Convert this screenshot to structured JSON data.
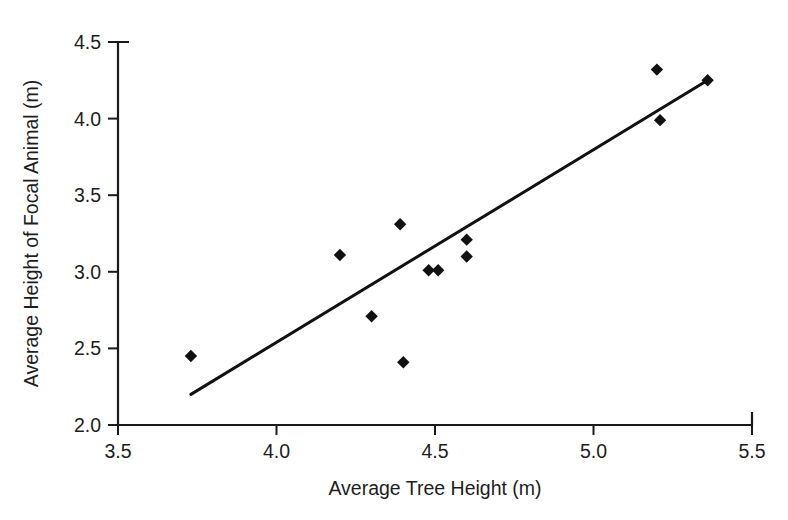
{
  "chart_data": {
    "type": "scatter",
    "title": "",
    "xlabel": "Average Tree Height (m)",
    "ylabel": "Average Height of Focal Animal (m)",
    "xlim": [
      3.5,
      5.5
    ],
    "ylim": [
      2.0,
      4.5
    ],
    "xticks": [
      3.5,
      4.0,
      4.5,
      5.0,
      5.5
    ],
    "yticks": [
      2.0,
      2.5,
      3.0,
      3.5,
      4.0,
      4.5
    ],
    "xtick_labels": [
      "3.5",
      "4.0",
      "4.5",
      "5.0",
      "5.5"
    ],
    "ytick_labels": [
      "2.0",
      "2.5",
      "3.0",
      "3.5",
      "4.0",
      "4.5"
    ],
    "grid": false,
    "legend": false,
    "marker_shape": "diamond",
    "marker_color": "#111111",
    "points": [
      {
        "x": 3.73,
        "y": 2.45
      },
      {
        "x": 4.2,
        "y": 3.11
      },
      {
        "x": 4.3,
        "y": 2.71
      },
      {
        "x": 4.39,
        "y": 3.31
      },
      {
        "x": 4.4,
        "y": 2.41
      },
      {
        "x": 4.48,
        "y": 3.01
      },
      {
        "x": 4.51,
        "y": 3.01
      },
      {
        "x": 4.6,
        "y": 3.21
      },
      {
        "x": 4.6,
        "y": 3.1
      },
      {
        "x": 5.2,
        "y": 4.32
      },
      {
        "x": 5.21,
        "y": 3.99
      },
      {
        "x": 5.36,
        "y": 4.25
      }
    ],
    "trend_line": {
      "type": "linear-fit",
      "x_start": 3.73,
      "y_start": 2.2,
      "x_end": 5.36,
      "y_end": 4.25
    }
  }
}
